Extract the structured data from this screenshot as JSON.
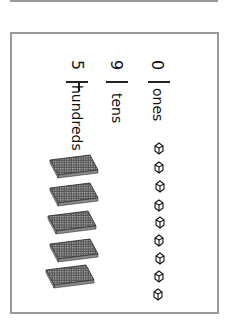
{
  "worksheet": {
    "number": "590",
    "columns": [
      {
        "digit": "5",
        "label": "hundreds"
      },
      {
        "digit": "9",
        "label": "tens"
      },
      {
        "digit": "0",
        "label": "ones"
      }
    ],
    "blocks": {
      "hundreds_flats": 5,
      "ones_cubes": 9
    }
  }
}
